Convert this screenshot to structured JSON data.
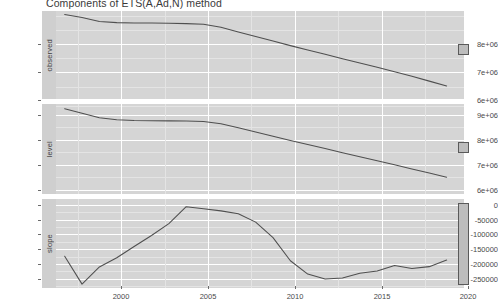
{
  "chart_data": {
    "type": "line",
    "title": "Components of ETS(A,Ad,N) method",
    "xlabel": "",
    "ylabel": "",
    "grid": true,
    "legend": "none",
    "facet_layout": "vertical-3-panel",
    "xlim": [
      1997.5,
      2021.0
    ],
    "x_ticks": [
      "2000",
      "2005",
      "2010",
      "2015",
      "2020"
    ],
    "x_tick_values": [
      2000,
      2005,
      2010,
      2015,
      2020
    ],
    "panels": [
      {
        "name": "observed",
        "strip_label": "observed",
        "ylim": [
          5600000,
          8700000
        ],
        "y_ticks": [
          "6e+06",
          "7e+06",
          "8e+06"
        ],
        "y_tick_values": [
          6000000,
          7000000,
          8000000
        ],
        "x": [
          1998,
          1999,
          2000,
          2001,
          2002,
          2003,
          2004,
          2005,
          2006,
          2007,
          2008,
          2009,
          2010,
          2011,
          2012,
          2013,
          2014,
          2015,
          2016,
          2017,
          2018,
          2019,
          2020
        ],
        "y": [
          8580000,
          8470000,
          8330000,
          8290000,
          8280000,
          8275000,
          8270000,
          8255000,
          8230000,
          8130000,
          7960000,
          7800000,
          7640000,
          7480000,
          7330000,
          7180000,
          7020000,
          6870000,
          6720000,
          6560000,
          6400000,
          6230000,
          6060000
        ],
        "scale_bar": {
          "shown": true,
          "shape": "square",
          "relative_height": 0.09
        }
      },
      {
        "name": "level",
        "strip_label": "level",
        "ylim": [
          5550000,
          9150000
        ],
        "y_ticks": [
          "6e+06",
          "7e+06",
          "8e+06",
          "9e+06"
        ],
        "y_tick_values": [
          6000000,
          7000000,
          8000000,
          9000000
        ],
        "x": [
          1998,
          1999,
          2000,
          2001,
          2002,
          2003,
          2004,
          2005,
          2006,
          2007,
          2008,
          2009,
          2010,
          2011,
          2012,
          2013,
          2014,
          2015,
          2016,
          2017,
          2018,
          2019,
          2020
        ],
        "y": [
          8960000,
          8780000,
          8600000,
          8520000,
          8490000,
          8480000,
          8475000,
          8470000,
          8450000,
          8360000,
          8200000,
          8030000,
          7860000,
          7690000,
          7530000,
          7370000,
          7200000,
          7040000,
          6880000,
          6720000,
          6550000,
          6390000,
          6220000
        ],
        "scale_bar": {
          "shown": true,
          "shape": "square",
          "relative_height": 0.08
        }
      },
      {
        "name": "slope",
        "strip_label": "slope",
        "ylim": [
          -262000,
          38000
        ],
        "y_ticks": [
          "-250000",
          "-200000",
          "-150000",
          "-100000",
          "-50000",
          "0"
        ],
        "y_tick_values": [
          -250000,
          -200000,
          -150000,
          -100000,
          -50000,
          0
        ],
        "x": [
          1998,
          1999,
          2000,
          2001,
          2002,
          2003,
          2004,
          2005,
          2006,
          2007,
          2008,
          2009,
          2010,
          2011,
          2012,
          2013,
          2014,
          2015,
          2016,
          2017,
          2018,
          2019,
          2020
        ],
        "y": [
          -155000,
          -249000,
          -191000,
          -160000,
          -122000,
          -85000,
          -45000,
          12000,
          5000,
          -2000,
          -12000,
          -40000,
          -92000,
          -170000,
          -215000,
          -232000,
          -228000,
          -212000,
          -205000,
          -186000,
          -196000,
          -190000,
          -168000,
          -145000
        ],
        "scale_bar": {
          "shown": true,
          "shape": "tall-bar",
          "relative_height": 0.88
        }
      }
    ]
  },
  "axis": {
    "x_tick_labels": [
      "2000",
      "2005",
      "2010",
      "2015",
      "2020"
    ]
  }
}
